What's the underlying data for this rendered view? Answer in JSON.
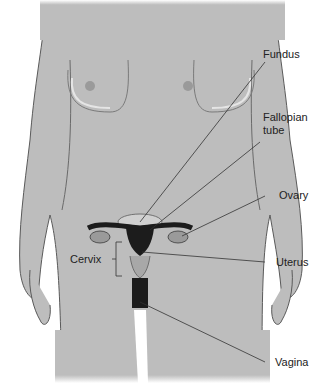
{
  "figure": {
    "colors": {
      "body": "#bdbdbd",
      "outline": "#5a5a5a",
      "organ_dark": "#1c1c1c",
      "organ_mid": "#8a8a8a",
      "leader": "#333333",
      "text": "#222222"
    }
  },
  "labels": {
    "fundus": "Fundus",
    "fallopian_tube_1": "Fallopian",
    "fallopian_tube_2": "tube",
    "ovary": "Ovary",
    "cervix": "Cervix",
    "uterus": "Uterus",
    "vagina": "Vagina"
  }
}
